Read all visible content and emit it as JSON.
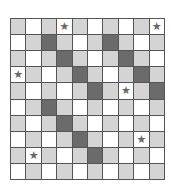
{
  "board": {
    "rows": 10,
    "cols": 10,
    "colors": {
      "W": "#ffffff",
      "L": "#d4d4d4",
      "D": "#6b6b6b",
      "star": "#6a6a6a"
    },
    "star_glyph": "★",
    "cells": [
      [
        "L",
        "W",
        "L",
        "W",
        "L",
        "W",
        "L",
        "W",
        "L",
        "W"
      ],
      [
        "W",
        "L",
        "D",
        "L",
        "W",
        "L",
        "D",
        "L",
        "W",
        "L"
      ],
      [
        "L",
        "W",
        "L",
        "D",
        "L",
        "W",
        "L",
        "D",
        "L",
        "W"
      ],
      [
        "W",
        "L",
        "W",
        "L",
        "D",
        "L",
        "W",
        "L",
        "D",
        "L"
      ],
      [
        "L",
        "W",
        "L",
        "W",
        "L",
        "D",
        "L",
        "W",
        "L",
        "D"
      ],
      [
        "W",
        "L",
        "D",
        "L",
        "W",
        "L",
        "W",
        "L",
        "W",
        "L"
      ],
      [
        "L",
        "W",
        "L",
        "D",
        "L",
        "W",
        "L",
        "W",
        "L",
        "W"
      ],
      [
        "W",
        "L",
        "W",
        "L",
        "D",
        "L",
        "W",
        "L",
        "W",
        "L"
      ],
      [
        "L",
        "W",
        "L",
        "W",
        "L",
        "D",
        "L",
        "W",
        "L",
        "W"
      ],
      [
        "W",
        "L",
        "W",
        "L",
        "W",
        "L",
        "W",
        "L",
        "W",
        "L"
      ]
    ],
    "stars": [
      [
        0,
        3
      ],
      [
        0,
        9
      ],
      [
        3,
        0
      ],
      [
        4,
        7
      ],
      [
        7,
        8
      ],
      [
        8,
        1
      ]
    ]
  }
}
